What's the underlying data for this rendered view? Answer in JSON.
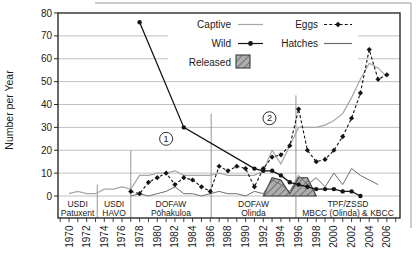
{
  "chart_data": {
    "type": "line",
    "title": "",
    "xlabel": "",
    "ylabel": "Number per Year",
    "ylim": [
      0,
      80
    ],
    "y_ticks": [
      0,
      10,
      20,
      30,
      40,
      50,
      60,
      70,
      80
    ],
    "x_range": [
      1968.75,
      2007.5
    ],
    "x_tick_label_years": [
      1970,
      1972,
      1974,
      1976,
      1978,
      1980,
      1982,
      1984,
      1986,
      1988,
      1990,
      1992,
      1994,
      1996,
      1998,
      2000,
      2002,
      2004,
      2006
    ],
    "x_minor_tick_years": [
      1969,
      1970,
      1971,
      1972,
      1973,
      1974,
      1975,
      1976,
      1977,
      1978,
      1979,
      1980,
      1981,
      1982,
      1983,
      1984,
      1985,
      1986,
      1987,
      1988,
      1989,
      1990,
      1991,
      1992,
      1993,
      1994,
      1995,
      1996,
      1997,
      1998,
      1999,
      2000,
      2001,
      2002,
      2003,
      2004,
      2005,
      2006,
      2007
    ],
    "grid": true,
    "legend_position": "top-center-inside",
    "legend": [
      {
        "label": "Captive",
        "style": "thin-gray-line"
      },
      {
        "label": "Wild",
        "style": "black-line-filled-circle-markers"
      },
      {
        "label": "Released",
        "style": "gray-hatched-square"
      },
      {
        "label": "Eggs",
        "style": "black-dashed-line-diamond-markers"
      },
      {
        "label": "Hatches",
        "style": "thin-gray-line"
      }
    ],
    "series": [
      {
        "name": "Captive",
        "type": "line",
        "points": [
          [
            1970,
            1
          ],
          [
            1971,
            2
          ],
          [
            1972,
            1
          ],
          [
            1973,
            1
          ],
          [
            1974,
            3
          ],
          [
            1975,
            3
          ],
          [
            1976,
            4
          ],
          [
            1977,
            3
          ],
          [
            1978,
            9
          ],
          [
            1979,
            9
          ],
          [
            1980,
            10
          ],
          [
            1981,
            10
          ],
          [
            1982,
            11
          ],
          [
            1983,
            9
          ],
          [
            1984,
            9
          ],
          [
            1985,
            9
          ],
          [
            1986,
            9
          ],
          [
            1987,
            10
          ],
          [
            1988,
            9
          ],
          [
            1989,
            9
          ],
          [
            1990,
            9
          ],
          [
            1991,
            9
          ],
          [
            1992,
            11
          ],
          [
            1993,
            20
          ],
          [
            1994,
            14
          ],
          [
            1995,
            22
          ],
          [
            1996,
            30
          ],
          [
            1997,
            30
          ],
          [
            1998,
            30
          ],
          [
            1999,
            31
          ],
          [
            2000,
            33
          ],
          [
            2001,
            36
          ],
          [
            2002,
            43
          ],
          [
            2003,
            51
          ],
          [
            2004,
            58
          ],
          [
            2005,
            56
          ],
          [
            2006,
            52
          ]
        ]
      },
      {
        "name": "Hatches",
        "type": "line",
        "points": [
          [
            1977,
            0
          ],
          [
            1978,
            1
          ],
          [
            1979,
            0
          ],
          [
            1980,
            1
          ],
          [
            1981,
            2
          ],
          [
            1982,
            4
          ],
          [
            1983,
            1
          ],
          [
            1984,
            1
          ],
          [
            1985,
            0
          ],
          [
            1986,
            1
          ],
          [
            1987,
            2
          ],
          [
            1988,
            1
          ],
          [
            1989,
            1
          ],
          [
            1990,
            0
          ],
          [
            1991,
            2
          ],
          [
            1992,
            1
          ],
          [
            1993,
            7
          ],
          [
            1994,
            5
          ],
          [
            1995,
            2
          ],
          [
            1996,
            9
          ],
          [
            1997,
            5
          ],
          [
            1998,
            8
          ],
          [
            1999,
            4
          ],
          [
            2000,
            10
          ],
          [
            2001,
            5
          ],
          [
            2002,
            12
          ],
          [
            2003,
            9
          ],
          [
            2004,
            7
          ],
          [
            2005,
            5
          ]
        ]
      },
      {
        "name": "Released",
        "type": "area",
        "points": [
          [
            1992,
            0
          ],
          [
            1993,
            8
          ],
          [
            1994,
            7
          ],
          [
            1995,
            1
          ],
          [
            1996,
            8
          ],
          [
            1997,
            8
          ],
          [
            1998,
            0
          ]
        ]
      },
      {
        "name": "Wild",
        "type": "line-markers",
        "points": [
          [
            1978,
            76
          ],
          [
            1983,
            30
          ],
          [
            1991,
            12
          ],
          [
            1992,
            11
          ],
          [
            1993,
            11
          ],
          [
            1994,
            9
          ],
          [
            1995,
            6
          ],
          [
            1996,
            5
          ],
          [
            1997,
            4
          ],
          [
            1998,
            3
          ],
          [
            1999,
            3
          ],
          [
            2000,
            3
          ],
          [
            2001,
            2
          ],
          [
            2002,
            2
          ],
          [
            2003,
            0
          ]
        ]
      },
      {
        "name": "Eggs",
        "type": "dashed-line-diamond-markers",
        "points": [
          [
            1977,
            2
          ],
          [
            1978,
            1
          ],
          [
            1979,
            6
          ],
          [
            1980,
            8
          ],
          [
            1981,
            10
          ],
          [
            1982,
            5
          ],
          [
            1983,
            8
          ],
          [
            1984,
            7
          ],
          [
            1985,
            4
          ],
          [
            1986,
            2
          ],
          [
            1987,
            13
          ],
          [
            1988,
            11
          ],
          [
            1989,
            13
          ],
          [
            1990,
            12
          ],
          [
            1991,
            4
          ],
          [
            1992,
            12
          ],
          [
            1993,
            17
          ],
          [
            1994,
            18
          ],
          [
            1995,
            22
          ],
          [
            1996,
            38
          ],
          [
            1997,
            20
          ],
          [
            1998,
            15
          ],
          [
            1999,
            16
          ],
          [
            2000,
            20
          ],
          [
            2001,
            26
          ],
          [
            2002,
            34
          ],
          [
            2003,
            45
          ],
          [
            2004,
            64
          ],
          [
            2005,
            51
          ],
          [
            2006,
            53
          ]
        ]
      }
    ],
    "annotations": [
      {
        "label": "1",
        "year": 1981,
        "value": 25
      },
      {
        "label": "2",
        "year": 1992.7,
        "value": 34
      }
    ],
    "facility_periods": [
      {
        "line1": "USDI",
        "line2": "Patuxent"
      },
      {
        "line1": "USDI",
        "line2": "HAVO"
      },
      {
        "line1": "DOFAW",
        "line2": "Pōhakuloa"
      },
      {
        "line1": "DOFAW",
        "line2": "Olinda"
      },
      {
        "line1": "TPF/ZSSD",
        "line2": "MBCC (Olinda) & KBCC"
      }
    ],
    "dividers": [
      {
        "year": 1973.2,
        "top_value": 5
      },
      {
        "year": 1977.0,
        "top_value": 20
      },
      {
        "year": 1986.1,
        "top_value": 36
      },
      {
        "year": 1995.7,
        "top_value": 44
      }
    ],
    "colors": {
      "grid": "#b9b9b9",
      "frame": "#2b2b2b",
      "text": "#1a1a1a",
      "captive": "#a6a6a6",
      "hatches": "#6e6e6e",
      "wild": "#141414",
      "eggs": "#141414",
      "released_fill": "#aeaeae",
      "released_stripe": "#5f5f5f",
      "released_stroke": "#3c3c3c",
      "divider": "#8a8a8a",
      "scan_border": "#9a9a9a",
      "background": "#ffffff"
    }
  }
}
